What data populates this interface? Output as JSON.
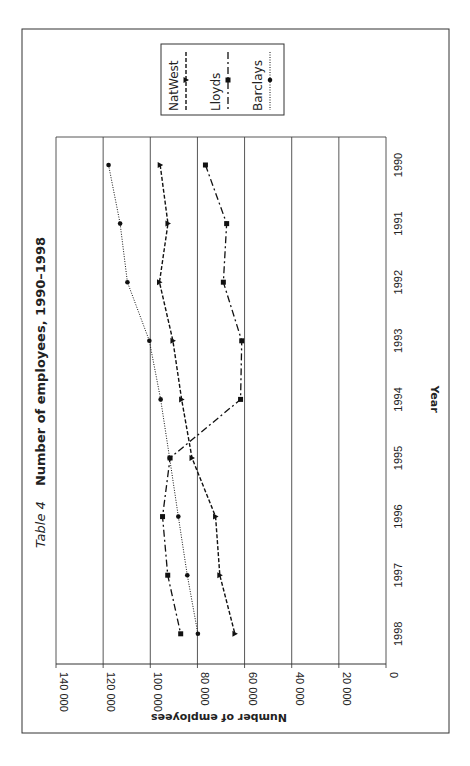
{
  "chart_data": {
    "type": "line",
    "orientation": "rotated-90-clockwise",
    "title_prefix": "Table 4",
    "title": "Number of employees, 1990–1998",
    "xlabel": "Year",
    "ylabel": "Number of employees",
    "categories": [
      "1990",
      "1991",
      "1992",
      "1993",
      "1994",
      "1995",
      "1996",
      "1997",
      "1998"
    ],
    "ylim": [
      0,
      140000
    ],
    "yticks": [
      0,
      20000,
      40000,
      60000,
      80000,
      100000,
      120000,
      140000
    ],
    "ytick_labels": [
      "0",
      "20 000",
      "40 000",
      "60 000",
      "80 000",
      "100 000",
      "120 000",
      "140 000"
    ],
    "grid": true,
    "legend_position": "top",
    "series": [
      {
        "name": "NatWest",
        "style": "dashed",
        "marker": "triangle",
        "values": [
          95800,
          92500,
          96100,
          90400,
          86700,
          82300,
          72300,
          70500,
          64100
        ]
      },
      {
        "name": "Lloyds",
        "style": "dash-dot",
        "marker": "square",
        "values": [
          76600,
          67600,
          69000,
          61200,
          61700,
          91600,
          94800,
          92600,
          87100
        ]
      },
      {
        "name": "Barclays",
        "style": "dotted",
        "marker": "circle",
        "values": [
          117700,
          112800,
          109700,
          100400,
          95600,
          91800,
          88100,
          84300,
          79800
        ]
      }
    ]
  }
}
